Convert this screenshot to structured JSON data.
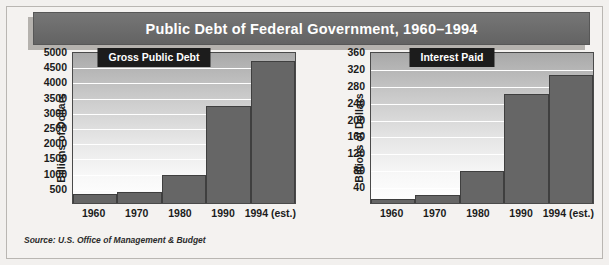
{
  "figure": {
    "title": "Public Debt of Federal Government, 1960–1994",
    "source": "Source: U.S. Office of Management & Budget",
    "accent_banner_color": "#6d6d6d",
    "panel_banner_color": "#1c1c1c",
    "bar_color": "#666666",
    "gridline_color": "#ffffff"
  },
  "chart_data": [
    {
      "type": "bar",
      "title": "Gross Public Debt",
      "xlabel": "",
      "ylabel": "Billions of Dollars",
      "categories": [
        "1960",
        "1970",
        "1980",
        "1990",
        "1994 (est.)"
      ],
      "values": [
        286,
        371,
        909,
        3207,
        4676
      ],
      "ylim": [
        0,
        5000
      ],
      "yticks": [
        500,
        1000,
        1500,
        2000,
        2500,
        3000,
        3500,
        4000,
        4500,
        5000
      ],
      "grid": true,
      "legend": "none"
    },
    {
      "type": "bar",
      "title": "Interest Paid",
      "xlabel": "",
      "ylabel": "Billions of Dollars",
      "categories": [
        "1960",
        "1970",
        "1980",
        "1990",
        "1994 (est.)"
      ],
      "values": [
        9,
        19,
        75,
        259,
        303
      ],
      "ylim": [
        0,
        360
      ],
      "yticks": [
        40,
        80,
        120,
        160,
        200,
        240,
        280,
        320,
        360
      ],
      "grid": true,
      "legend": "none"
    }
  ]
}
